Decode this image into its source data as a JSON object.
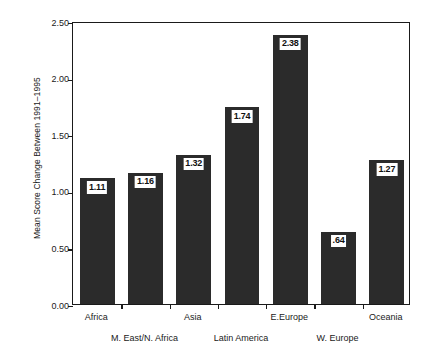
{
  "chart_data": {
    "type": "bar",
    "title": "",
    "subtitle": "",
    "xlabel": "",
    "ylabel": "Mean Score Change Between 1991–1995",
    "categories": [
      "Africa",
      "M. East/N. Africa",
      "Asia",
      "Latin America",
      "E.Europe",
      "W. Europe",
      "Oceania"
    ],
    "values": [
      1.11,
      1.16,
      1.32,
      1.74,
      2.38,
      0.64,
      1.27
    ],
    "value_labels": [
      "1.11",
      "1.16",
      "1.32",
      "1.74",
      "2.38",
      ".64",
      "1.27"
    ],
    "ylim": [
      0.0,
      2.5
    ],
    "ytick_labels": [
      "0.00",
      "0.50",
      "1.00",
      "1.50",
      "2.00",
      "2.50"
    ],
    "ytick_values": [
      0.0,
      0.5,
      1.0,
      1.5,
      2.0,
      2.5
    ],
    "grid": false,
    "legend": null,
    "bar_color": "#2b2b2b",
    "axis_color": "#1a1a1a",
    "background_color": "#ffffff",
    "label_rows": [
      0,
      1,
      0,
      1,
      0,
      1,
      0
    ]
  }
}
